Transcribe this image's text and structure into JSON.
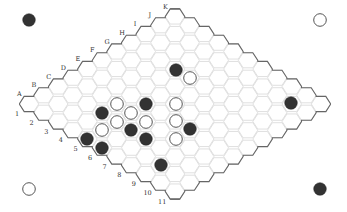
{
  "game": "Hex",
  "board": {
    "size": 11,
    "letters": [
      "A",
      "B",
      "C",
      "D",
      "E",
      "F",
      "G",
      "H",
      "I",
      "J",
      "K"
    ],
    "numbers": [
      "1",
      "2",
      "3",
      "4",
      "5",
      "6",
      "7",
      "8",
      "9",
      "10",
      "11"
    ]
  },
  "colors": {
    "black": "#333333",
    "white": "#ffffff",
    "grid": "#d8d8d8",
    "edge": "#666666"
  },
  "corner_stones": [
    {
      "position": "top-left",
      "color": "black",
      "x": 29,
      "y": 20
    },
    {
      "position": "top-right",
      "color": "white",
      "x": 320,
      "y": 20
    },
    {
      "position": "bottom-left",
      "color": "white",
      "x": 29,
      "y": 189
    },
    {
      "position": "bottom-right",
      "color": "black",
      "x": 320,
      "y": 189
    }
  ],
  "stones": [
    {
      "color": "black",
      "x": 176,
      "y": 70
    },
    {
      "color": "white",
      "x": 190,
      "y": 78
    },
    {
      "color": "black",
      "x": 102,
      "y": 113
    },
    {
      "color": "white",
      "x": 117,
      "y": 104
    },
    {
      "color": "white",
      "x": 131,
      "y": 113
    },
    {
      "color": "black",
      "x": 146,
      "y": 104
    },
    {
      "color": "white",
      "x": 117,
      "y": 122
    },
    {
      "color": "white",
      "x": 146,
      "y": 122
    },
    {
      "color": "white",
      "x": 102,
      "y": 130
    },
    {
      "color": "black",
      "x": 131,
      "y": 130
    },
    {
      "color": "black",
      "x": 146,
      "y": 139
    },
    {
      "color": "white",
      "x": 176,
      "y": 104
    },
    {
      "color": "white",
      "x": 176,
      "y": 121
    },
    {
      "color": "white",
      "x": 176,
      "y": 139
    },
    {
      "color": "black",
      "x": 190,
      "y": 129
    },
    {
      "color": "black",
      "x": 87,
      "y": 139
    },
    {
      "color": "black",
      "x": 102,
      "y": 148
    },
    {
      "color": "black",
      "x": 161,
      "y": 165
    },
    {
      "color": "black",
      "x": 291,
      "y": 103
    }
  ]
}
